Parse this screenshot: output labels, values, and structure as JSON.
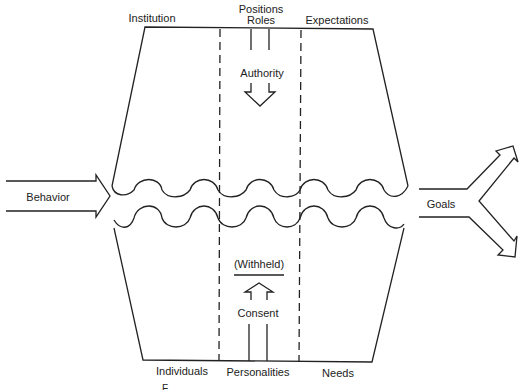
{
  "diagram": {
    "type": "social-system-model",
    "top_labels": {
      "left": "Institution",
      "middle_line1": "Positions",
      "middle_line2": "Roles",
      "right": "Expectations"
    },
    "bottom_labels": {
      "left": "Individuals",
      "middle": "Personalities",
      "right": "Needs"
    },
    "inner_labels": {
      "authority": "Authority",
      "withheld": "(Withheld)",
      "consent": "Consent"
    },
    "input_arrow": {
      "label": "Behavior"
    },
    "output_arrow": {
      "label": "Goals"
    },
    "caption_partial": "F...",
    "colors": {
      "line": "#222222",
      "background": "#ffffff"
    }
  }
}
